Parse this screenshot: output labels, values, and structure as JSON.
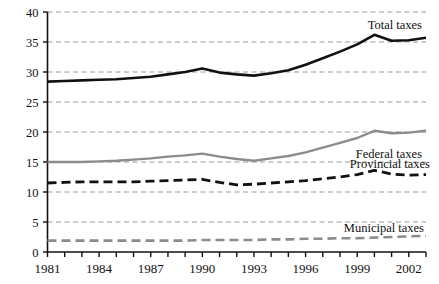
{
  "axes": {
    "ylabel": "$2003 thousands",
    "yticks": [
      "0",
      "5",
      "10",
      "15",
      "20",
      "25",
      "30",
      "35",
      "40"
    ],
    "xticks_labeled": [
      "1981",
      "1984",
      "1987",
      "1990",
      "1993",
      "1996",
      "1999",
      "2002"
    ],
    "ylim": [
      0,
      40
    ],
    "xlim": [
      1981,
      2003
    ]
  },
  "labels": {
    "total": "Total taxes",
    "federal": "Federal taxes",
    "provincial": "Provincial taxes",
    "municipal": "Municipal taxes"
  },
  "colors": {
    "total": "#111111",
    "federal": "#8c8c8c",
    "provincial": "#111111",
    "municipal": "#8c8c8c",
    "grid": "#9a9a9a",
    "axis": "#111111"
  },
  "chart_data": {
    "type": "line",
    "title": "",
    "xlabel": "",
    "ylabel": "$2003 thousands",
    "ylim": [
      0,
      40
    ],
    "grid": true,
    "legend": "inline-labels",
    "x": [
      1981,
      1982,
      1983,
      1984,
      1985,
      1986,
      1987,
      1988,
      1989,
      1990,
      1991,
      1992,
      1993,
      1994,
      1995,
      1996,
      1997,
      1998,
      1999,
      2000,
      2001,
      2002,
      2003
    ],
    "series": [
      {
        "name": "Total taxes",
        "style": "solid",
        "color": "#111111",
        "values": [
          28.4,
          28.5,
          28.6,
          28.7,
          28.8,
          29.0,
          29.2,
          29.6,
          30.0,
          30.6,
          29.9,
          29.6,
          29.4,
          29.8,
          30.3,
          31.2,
          32.3,
          33.4,
          34.6,
          36.2,
          35.2,
          35.3,
          35.7
        ]
      },
      {
        "name": "Federal taxes",
        "style": "solid",
        "color": "#8c8c8c",
        "values": [
          15.0,
          15.0,
          15.0,
          15.1,
          15.2,
          15.4,
          15.6,
          15.9,
          16.1,
          16.4,
          15.9,
          15.5,
          15.2,
          15.6,
          16.0,
          16.6,
          17.4,
          18.2,
          19.0,
          20.2,
          19.8,
          19.9,
          20.2
        ]
      },
      {
        "name": "Provincial taxes",
        "style": "dashed",
        "color": "#111111",
        "values": [
          11.5,
          11.6,
          11.7,
          11.7,
          11.7,
          11.7,
          11.8,
          11.9,
          12.0,
          12.1,
          11.6,
          11.2,
          11.3,
          11.5,
          11.7,
          11.9,
          12.2,
          12.5,
          12.9,
          13.6,
          13.0,
          12.8,
          12.9
        ]
      },
      {
        "name": "Municipal taxes",
        "style": "dashed",
        "color": "#8c8c8c",
        "values": [
          1.9,
          1.9,
          1.9,
          1.9,
          1.9,
          1.9,
          1.9,
          1.9,
          1.9,
          2.0,
          2.0,
          2.0,
          2.0,
          2.1,
          2.1,
          2.2,
          2.2,
          2.3,
          2.3,
          2.4,
          2.5,
          2.6,
          2.7
        ]
      }
    ]
  }
}
